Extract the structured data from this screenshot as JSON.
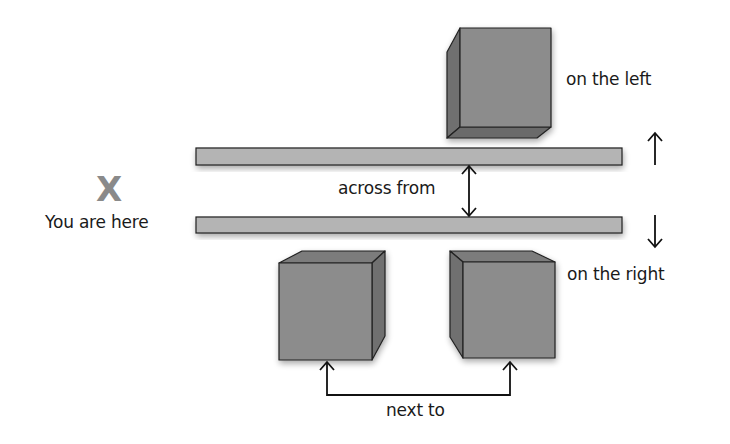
{
  "diagram": {
    "marker": {
      "symbol": "X",
      "label": "You are here"
    },
    "labels": {
      "on_the_left": "on the left",
      "across_from": "across from",
      "on_the_right": "on the right",
      "next_to": "next to"
    },
    "elements": [
      {
        "id": "building-top",
        "type": "cube",
        "position": "across the street, on the left"
      },
      {
        "id": "street-edge-top",
        "type": "bar"
      },
      {
        "id": "street-edge-bottom",
        "type": "bar"
      },
      {
        "id": "building-bottom-left",
        "type": "cube",
        "position": "on the right"
      },
      {
        "id": "building-bottom-right",
        "type": "cube",
        "position": "on the right"
      }
    ],
    "colors": {
      "cube_front": "#8c8c8c",
      "cube_side": "#6f6f6f",
      "cube_top": "#7b7b7b",
      "bar_fill": "#b4b4b4",
      "outline": "#222222",
      "marker": "#8a8a8a",
      "text": "#1a1a1a"
    }
  }
}
